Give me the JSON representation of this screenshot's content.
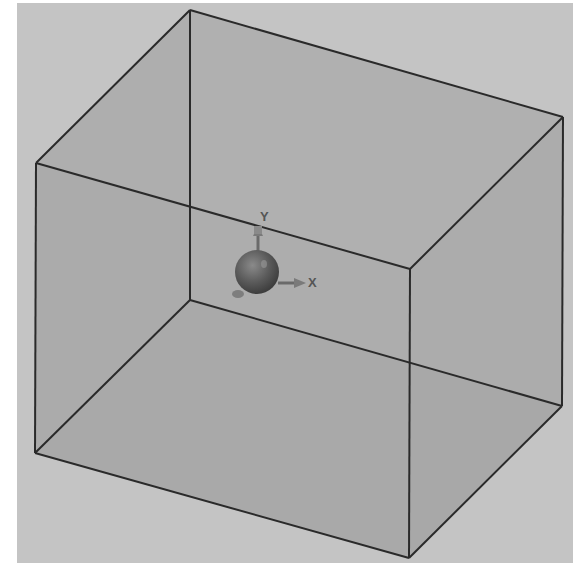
{
  "viewport": {
    "background": "#c4c4c4",
    "face_fill": "#a9a9a9",
    "edge_color": "#2a2a2a"
  },
  "box": {
    "vertices": {
      "top_back_left": [
        190,
        10
      ],
      "top_back_right": [
        563,
        117
      ],
      "top_front_left": [
        36,
        163
      ],
      "top_front_right": [
        410,
        269
      ],
      "bottom_back_left": [
        190,
        300
      ],
      "bottom_back_right": [
        562,
        406
      ],
      "bottom_front_left": [
        35,
        453
      ],
      "bottom_front_right": [
        409,
        558
      ]
    }
  },
  "origin_marker": {
    "center": [
      257,
      272
    ],
    "radius": 22,
    "color": "#5e5e5e"
  },
  "axes": {
    "y_label": "Y",
    "x_label": "X"
  }
}
